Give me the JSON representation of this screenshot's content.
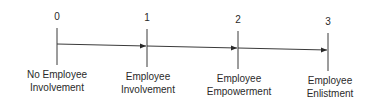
{
  "diagram": {
    "title": "",
    "stages": [
      {
        "number": "0",
        "label_lines": [
          "No Employee",
          "Involvement"
        ]
      },
      {
        "number": "1",
        "label_lines": [
          "Employee",
          "Involvement"
        ]
      },
      {
        "number": "2",
        "label_lines": [
          "Employee",
          "Empowerment"
        ]
      },
      {
        "number": "3",
        "label_lines": [
          "Employee",
          "Enlistment"
        ]
      }
    ],
    "colors": {
      "ink": "#2a2a2a",
      "background": "#ffffff"
    }
  }
}
